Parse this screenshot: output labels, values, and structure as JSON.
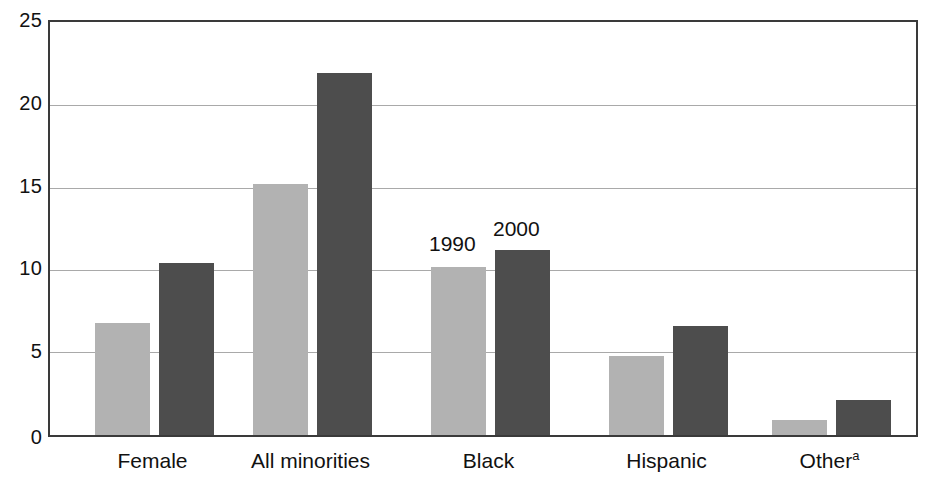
{
  "chart_data": {
    "type": "bar",
    "title": "",
    "subtitle": "",
    "xlabel": "",
    "ylabel": "",
    "ylim": [
      0,
      25
    ],
    "yticks": [
      0,
      5,
      10,
      15,
      20,
      25
    ],
    "grid": true,
    "legend_position": "in-plot-annotation",
    "categories": [
      "Female",
      "All minorities",
      "Black",
      "Hispanic",
      "Other"
    ],
    "category_labels": [
      {
        "text": "Female",
        "superscript": ""
      },
      {
        "text": "All minorities",
        "superscript": ""
      },
      {
        "text": "Black",
        "superscript": ""
      },
      {
        "text": "Hispanic",
        "superscript": ""
      },
      {
        "text": "Other",
        "superscript": "a"
      }
    ],
    "series": [
      {
        "name": "1990",
        "color": "#b2b2b2",
        "values": [
          6.8,
          15.2,
          10.2,
          4.8,
          0.9
        ]
      },
      {
        "name": "2000",
        "color": "#4d4d4d",
        "values": [
          10.4,
          21.9,
          11.2,
          6.6,
          2.1
        ]
      }
    ],
    "annotations": [
      {
        "text": "1990",
        "series": "1990",
        "near_category": "Black"
      },
      {
        "text": "2000",
        "series": "2000",
        "near_category": "Black"
      }
    ]
  },
  "axis": {
    "y": {
      "tick_25": "25",
      "tick_20": "20",
      "tick_15": "15",
      "tick_10": "10",
      "tick_5": "5",
      "tick_0": "0"
    }
  },
  "labels": {
    "cat_0": "Female",
    "cat_1": "All minorities",
    "cat_2": "Black",
    "cat_3": "Hispanic",
    "cat_4": "Other",
    "cat_4_sup": "a",
    "annot_1990": "1990",
    "annot_2000": "2000"
  },
  "colors": {
    "series_1990": "#b2b2b2",
    "series_2000": "#4d4d4d",
    "gridline": "#a9a9a9",
    "frame": "#3a3a3a",
    "background": "#ffffff",
    "text": "#111111"
  }
}
